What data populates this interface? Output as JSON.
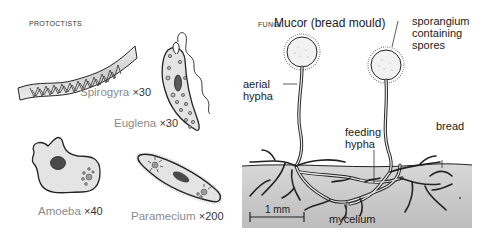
{
  "protoctists": {
    "section_label": "PROTOCTISTS",
    "organisms": [
      {
        "name": "Spirogyra",
        "magnification": "×30"
      },
      {
        "name": "Euglena",
        "magnification": "×30"
      },
      {
        "name": "Amoeba",
        "magnification": "×40"
      },
      {
        "name": "Paramecium",
        "magnification": "×200"
      }
    ]
  },
  "fungi": {
    "section_label": "FUNGI",
    "title": "Mucor (bread mould)",
    "labels": {
      "sporangium_line1": "sporangium",
      "sporangium_line2": "containing",
      "sporangium_line3": "spores",
      "aerial_line1": "aerial",
      "aerial_line2": "hypha",
      "feeding_line1": "feeding",
      "feeding_line2": "hypha",
      "bread": "bread",
      "mycelium": "mycelium",
      "scale": "1 mm"
    }
  },
  "colors": {
    "cell_fill": "#e4e4e4",
    "nucleus": "#4a4a4a",
    "bread_fill": "#c8c8c8",
    "caption_gray": "#8a8a8a"
  }
}
